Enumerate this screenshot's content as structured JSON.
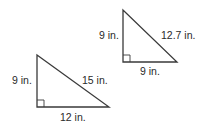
{
  "diagram": {
    "triangles": [
      {
        "id": "triangle-top-right",
        "vertices": {
          "top": [
            123,
            10
          ],
          "right_angle": [
            123,
            62
          ],
          "right": [
            177,
            62
          ]
        },
        "labels": {
          "vertical_leg": "9 in.",
          "hypotenuse": "12.7 in.",
          "horizontal_leg": "9 in."
        }
      },
      {
        "id": "triangle-bottom-left",
        "vertices": {
          "top": [
            37,
            55
          ],
          "right_angle": [
            37,
            107
          ],
          "right": [
            109,
            107
          ]
        },
        "labels": {
          "vertical_leg": "9 in.",
          "hypotenuse": "15 in.",
          "horizontal_leg": "12 in."
        }
      }
    ],
    "colors": {
      "stroke": "#3a3a3a",
      "text": "#2a2a2a",
      "background": "#ffffff"
    }
  }
}
